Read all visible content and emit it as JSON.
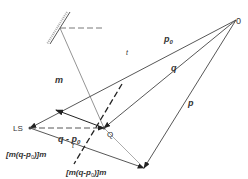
{
  "diagram": {
    "colors": {
      "line": "#444444",
      "light": "#888888",
      "bg": "#ffffff"
    },
    "points": {
      "LS": {
        "label": "LS",
        "x": 30,
        "y": 128
      },
      "Q": {
        "label": "Q",
        "x": 104,
        "y": 128
      },
      "O": {
        "label": "0",
        "x": 236,
        "y": 20
      },
      "tip": {
        "x": 144,
        "y": 168
      },
      "mirror": {
        "x": 60,
        "y": 28
      }
    },
    "labels": {
      "p0": "p",
      "p0_sub": "0",
      "q": "q",
      "p": "p",
      "m": "m",
      "t_upper": "t",
      "t_lower": "t",
      "q_minus_p0": "q - p",
      "q_minus_p0_sub": "0",
      "proj_left": "[m(q-p",
      "proj_left_sub": "0",
      "proj_left_end": ")]m",
      "proj_bottom": "[m(q-p",
      "proj_bottom_sub": "0",
      "proj_bottom_end": ")]m"
    }
  }
}
